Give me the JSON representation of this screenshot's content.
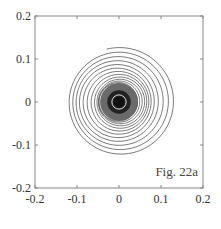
{
  "chart_data": {
    "type": "line",
    "title": "",
    "annotation": "Fig. 22a",
    "xlabel": "",
    "ylabel": "",
    "xlim": [
      -0.2,
      0.2
    ],
    "ylim": [
      -0.2,
      0.2
    ],
    "xticks": [
      -0.2,
      -0.1,
      0,
      0.1,
      0.2
    ],
    "yticks": [
      -0.2,
      -0.1,
      0,
      0.1,
      0.2
    ],
    "xtick_labels": [
      "-0.2",
      "-0.1",
      "0",
      "0.1",
      "0.2"
    ],
    "ytick_labels": [
      "-0.2",
      "-0.1",
      "0",
      "0.1",
      "0.2"
    ],
    "grid": false,
    "series": [
      {
        "name": "spiral trajectory",
        "description": "Inward spiral converging toward origin, outer radius ~0.13, dense dark core radius ~0.045 with a light ring near radius ~0.015",
        "outer_radius": 0.13,
        "core_radius": 0.045,
        "turns": 12,
        "color": "#555555"
      }
    ]
  }
}
